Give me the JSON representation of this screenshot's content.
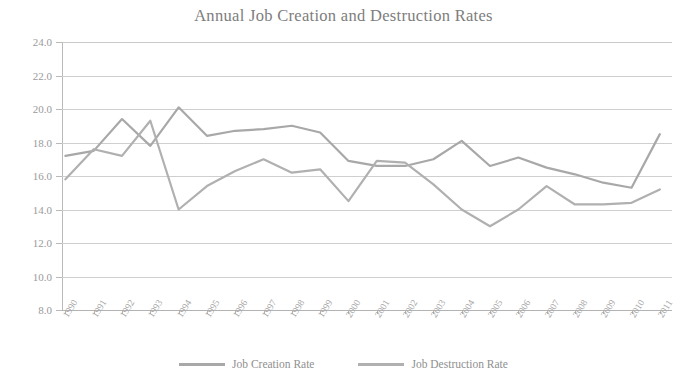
{
  "chart_data": {
    "type": "line",
    "title": "Annual Job Creation and Destruction Rates",
    "xlabel": "",
    "ylabel": "",
    "ylim": [
      8.0,
      24.0
    ],
    "ytick_step": 2.0,
    "ytick_labels": [
      "24.0",
      "22.0",
      "20.0",
      "18.0",
      "16.0",
      "14.0",
      "12.0",
      "10.0",
      "8.0"
    ],
    "grid": true,
    "legend_position": "bottom",
    "categories": [
      "1990",
      "1991",
      "1992",
      "1993",
      "1994",
      "1995",
      "1996",
      "1997",
      "1998",
      "1999",
      "2000",
      "2001",
      "2002",
      "2003",
      "2004",
      "2005",
      "2006",
      "2007",
      "2008",
      "2009",
      "2010",
      "2011"
    ],
    "series": [
      {
        "name": "Job Creation Rate",
        "color": "#a8a8a8",
        "values": [
          17.2,
          17.5,
          19.4,
          17.8,
          20.1,
          18.4,
          18.7,
          18.8,
          19.0,
          18.6,
          16.9,
          16.6,
          16.6,
          17.0,
          18.1,
          16.6,
          17.1,
          16.5,
          16.1,
          15.6,
          15.3,
          18.5
        ]
      },
      {
        "name": "Job Destruction Rate",
        "color": "#b0b0b0",
        "values": [
          15.8,
          17.6,
          17.2,
          19.3,
          14.0,
          15.4,
          16.3,
          17.0,
          16.2,
          16.4,
          14.5,
          16.9,
          16.8,
          15.5,
          14.0,
          13.0,
          14.0,
          15.4,
          14.3,
          14.3,
          14.4,
          15.2
        ]
      }
    ],
    "series_full": [
      {
        "name": "Job Creation Rate",
        "points": [
          {
            "x": "1990",
            "y": 17.2
          },
          {
            "x": "1991",
            "y": 17.5
          },
          {
            "x": "1992",
            "y": 19.4
          },
          {
            "x": "1993",
            "y": 17.8
          },
          {
            "x": "1994",
            "y": 20.1
          },
          {
            "x": "1995",
            "y": 18.4
          },
          {
            "x": "1996",
            "y": 18.7
          },
          {
            "x": "1997",
            "y": 18.8
          },
          {
            "x": "1998",
            "y": 19.0
          },
          {
            "x": "1999",
            "y": 18.6
          },
          {
            "x": "2000",
            "y": 16.9
          },
          {
            "x": "2001",
            "y": 16.6
          },
          {
            "x": "2002",
            "y": 16.6
          },
          {
            "x": "2003",
            "y": 17.0
          },
          {
            "x": "2004",
            "y": 18.1
          },
          {
            "x": "2005",
            "y": 16.6
          },
          {
            "x": "2006",
            "y": 17.1
          },
          {
            "x": "2007",
            "y": 16.5
          },
          {
            "x": "2008",
            "y": 16.1
          },
          {
            "x": "2009",
            "y": 15.6
          },
          {
            "x": "2010",
            "y": 15.3
          },
          {
            "x": "2011",
            "y": 18.5
          }
        ]
      },
      {
        "name": "Job Destruction Rate",
        "points": [
          {
            "x": "1990",
            "y": 15.8
          },
          {
            "x": "1991",
            "y": 17.6
          },
          {
            "x": "1992",
            "y": 17.2
          },
          {
            "x": "1993",
            "y": 19.3
          },
          {
            "x": "1994",
            "y": 14.0
          },
          {
            "x": "1995",
            "y": 15.4
          },
          {
            "x": "1996",
            "y": 16.3
          },
          {
            "x": "1997",
            "y": 17.0
          },
          {
            "x": "1998",
            "y": 16.2
          },
          {
            "x": "1999",
            "y": 16.4
          },
          {
            "x": "2000",
            "y": 14.5
          },
          {
            "x": "2001",
            "y": 16.9
          },
          {
            "x": "2002",
            "y": 16.8
          },
          {
            "x": "2003",
            "y": 15.5
          },
          {
            "x": "2004",
            "y": 14.0
          },
          {
            "x": "2005",
            "y": 13.0
          },
          {
            "x": "2006",
            "y": 14.0
          },
          {
            "x": "2007",
            "y": 15.4
          },
          {
            "x": "2008",
            "y": 14.3
          },
          {
            "x": "2009",
            "y": 14.3
          },
          {
            "x": "2010",
            "y": 14.4
          },
          {
            "x": "2011",
            "y": 15.2
          }
        ]
      }
    ]
  },
  "legend": {
    "items": [
      {
        "label": "Job Creation Rate"
      },
      {
        "label": "Job Destruction Rate"
      }
    ]
  }
}
